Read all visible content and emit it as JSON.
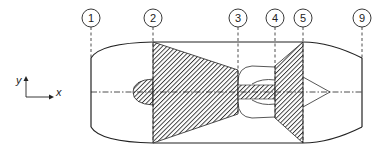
{
  "diagram": {
    "type": "turbojet engine station numbering schematic",
    "colors": {
      "line": "#222222",
      "hatch": "#333333",
      "background": "#ffffff"
    },
    "stations": [
      {
        "id": "1",
        "label": "1",
        "x": 91
      },
      {
        "id": "2",
        "label": "2",
        "x": 153
      },
      {
        "id": "3",
        "label": "3",
        "x": 238
      },
      {
        "id": "4",
        "label": "4",
        "x": 275
      },
      {
        "id": "5",
        "label": "5",
        "x": 303
      },
      {
        "id": "9",
        "label": "9",
        "x": 362
      }
    ],
    "axes": {
      "y_label": "y",
      "x_label": "x"
    },
    "components": [
      {
        "name": "inlet"
      },
      {
        "name": "compressor"
      },
      {
        "name": "combustor"
      },
      {
        "name": "turbine"
      },
      {
        "name": "nozzle"
      }
    ]
  }
}
